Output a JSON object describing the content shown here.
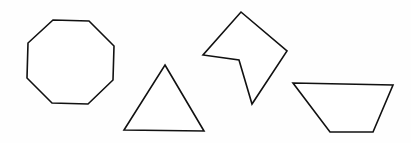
{
  "canvas": {
    "width": 411,
    "height": 143,
    "background": "#ffffff"
  },
  "style": {
    "stroke": "#111111",
    "fill": "#ffffff",
    "stroke_width": 1.6
  },
  "shapes": [
    {
      "name": "octagon",
      "sides": 8,
      "points": "53,20 89,21 114,46 113,80 88,104 52,103 27,78 28,43"
    },
    {
      "name": "triangle",
      "sides": 3,
      "points": "165,65 204,131 124,130"
    },
    {
      "name": "concave-pentagon",
      "sides": 5,
      "points": "241,12 287,51 252,104 239,60 203,55"
    },
    {
      "name": "trapezoid",
      "sides": 4,
      "points": "293,83 393,85 373,132 330,132"
    }
  ]
}
